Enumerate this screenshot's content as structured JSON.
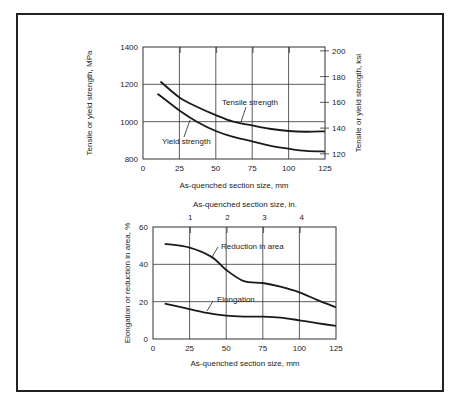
{
  "chart_data": [
    {
      "type": "line",
      "title": "",
      "xlabel": "As-quenched section size, mm",
      "ylabel": "Tensile or yield strength, MPa",
      "ylabel_right": "Tensile or yield strength, ksi",
      "xlim": [
        0,
        125
      ],
      "ylim": [
        800,
        1400
      ],
      "ylim_right": [
        116,
        203
      ],
      "x_ticks": [
        "0",
        "25",
        "50",
        "75",
        "100",
        "125"
      ],
      "y_ticks": [
        "800",
        "1000",
        "1200",
        "1400"
      ],
      "y_ticks_right": [
        "120",
        "140",
        "160",
        "180",
        "200"
      ],
      "grid": true,
      "series": [
        {
          "name": "Tensile strength",
          "x": [
            12,
            25,
            37,
            50,
            62,
            75,
            87,
            100,
            112,
            125
          ],
          "values": [
            1215,
            1130,
            1080,
            1035,
            1000,
            980,
            962,
            950,
            946,
            948
          ]
        },
        {
          "name": "Yield strength",
          "x": [
            10,
            25,
            37,
            50,
            62,
            75,
            87,
            100,
            112,
            125
          ],
          "values": [
            1150,
            1060,
            1000,
            950,
            918,
            895,
            872,
            855,
            843,
            840
          ]
        }
      ]
    },
    {
      "type": "line",
      "title": "",
      "xlabel": "As-quenched section size, mm",
      "xlabel_top": "As-quenched section size, in.",
      "ylabel": "Elongation or reduction in area, %",
      "xlim": [
        0,
        125
      ],
      "ylim": [
        0,
        60
      ],
      "x_ticks": [
        "0",
        "25",
        "50",
        "75",
        "100",
        "125"
      ],
      "x_ticks_top": [
        "1",
        "2",
        "3",
        "4"
      ],
      "y_ticks": [
        "0",
        "20",
        "40",
        "60"
      ],
      "grid": true,
      "series": [
        {
          "name": "Reduction in area",
          "x": [
            8,
            25,
            40,
            50,
            62,
            75,
            87,
            100,
            112,
            125
          ],
          "values": [
            51,
            49,
            44,
            37,
            31,
            30,
            28,
            25,
            21,
            17
          ]
        },
        {
          "name": "Elongation",
          "x": [
            8,
            25,
            37,
            50,
            62,
            75,
            87,
            100,
            112,
            125
          ],
          "values": [
            19,
            16,
            14,
            12.5,
            12,
            12,
            11.5,
            10,
            8.5,
            7
          ]
        }
      ]
    }
  ],
  "labels": {
    "top_xlabel": "As-quenched section size, mm",
    "top_ylabel_left": "Tensile or yield strength, MPa",
    "top_ylabel_right": "Tensile or yield strength, ksi",
    "tensile_label": "Tensile strength",
    "yield_label": "Yield strength",
    "bottom_xlabel_top": "As-quenched section size, in.",
    "bottom_xlabel": "As-quenched section size, mm",
    "bottom_ylabel": "Elongation or reduction in area, %",
    "reduction_label": "Reduction in area",
    "elongation_label": "Elongation"
  }
}
